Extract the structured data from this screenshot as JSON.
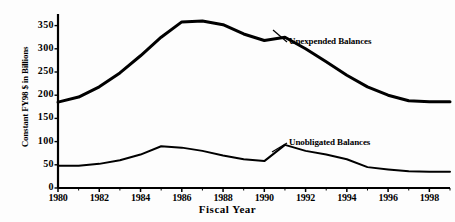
{
  "chart_data": {
    "type": "line",
    "title": "",
    "xlabel": "Fiscal Year",
    "ylabel": "Constant FY98 $ in Billions",
    "x": [
      1980,
      1981,
      1982,
      1983,
      1984,
      1985,
      1986,
      1987,
      1988,
      1989,
      1990,
      1991,
      1992,
      1993,
      1994,
      1995,
      1996,
      1997,
      1998,
      1999
    ],
    "xlim": [
      1980,
      1999
    ],
    "ylim": [
      0,
      375
    ],
    "grid": false,
    "legend_position": "inline-annotation",
    "xticks": [
      "1980",
      "1982",
      "1984",
      "1986",
      "1988",
      "1990",
      "1992",
      "1994",
      "1996",
      "1998"
    ],
    "xtick_values": [
      1980,
      1982,
      1984,
      1986,
      1988,
      1990,
      1992,
      1994,
      1996,
      1998
    ],
    "yticks": [
      "0",
      "50",
      "100",
      "150",
      "200",
      "250",
      "300",
      "350"
    ],
    "ytick_values": [
      0,
      50,
      100,
      150,
      200,
      250,
      300,
      350
    ],
    "series": [
      {
        "name": "Unexpended Balances",
        "values": [
          185,
          196,
          218,
          248,
          285,
          325,
          358,
          360,
          352,
          332,
          318,
          325,
          300,
          272,
          243,
          218,
          200,
          188,
          186,
          186
        ]
      },
      {
        "name": "Unobligated Balances",
        "values": [
          48,
          48,
          52,
          60,
          72,
          90,
          87,
          80,
          70,
          62,
          58,
          93,
          80,
          72,
          62,
          45,
          40,
          36,
          35,
          35
        ]
      }
    ],
    "annotations": [
      {
        "text": "Unexpended Balances",
        "series": "Unexpended Balances"
      },
      {
        "text": "Unobligated Balances",
        "series": "Unobligated Balances"
      }
    ],
    "colors": {
      "line": "#000000",
      "axis": "#000000",
      "background": "#ffffff"
    }
  },
  "axes": {
    "y_title": "Constant FY98 $ in Billions",
    "x_title": "Fiscal Year"
  }
}
